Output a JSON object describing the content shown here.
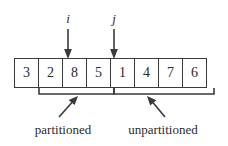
{
  "diagram": {
    "array": {
      "cells": [
        {
          "value": "3"
        },
        {
          "value": "2"
        },
        {
          "value": "8"
        },
        {
          "value": "5"
        },
        {
          "value": "1"
        },
        {
          "value": "4"
        },
        {
          "value": "7"
        },
        {
          "value": "6"
        }
      ],
      "cell_count": 8,
      "border_color": "#3a3a3a",
      "fill_color": "#ffffff",
      "text_color": "#2b2b2b"
    },
    "pointers": [
      {
        "name": "i",
        "label": "i",
        "icon": "down-arrow-icon",
        "target_cell_index": 2,
        "x": 68
      },
      {
        "name": "j",
        "label": "j",
        "icon": "down-arrow-icon",
        "target_cell_index": 4,
        "x": 114
      }
    ],
    "regions": [
      {
        "name": "partitioned",
        "label": "partitioned",
        "icon": "up-right-arrow-icon",
        "start_x": 39,
        "end_x": 114,
        "label_x": 63
      },
      {
        "name": "unpartitioned",
        "label": "unpartitioned",
        "icon": "up-left-arrow-icon",
        "start_x": 114,
        "end_x": 214,
        "label_x": 163
      }
    ],
    "stroke_color": "#3a3a3a"
  }
}
